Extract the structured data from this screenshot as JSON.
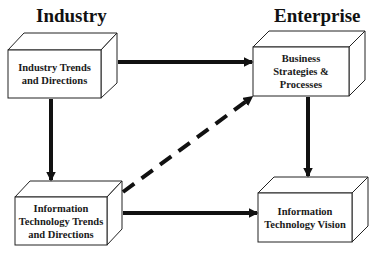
{
  "headings": {
    "left": "Industry",
    "right": "Enterprise"
  },
  "boxes": {
    "industry_trends": {
      "lines": [
        "Industry Trends",
        "and Directions"
      ]
    },
    "business_strategies": {
      "lines": [
        "Business",
        "Strategies &",
        "Processes"
      ]
    },
    "it_trends": {
      "lines": [
        "Information",
        "Technology Trends",
        "and Directions"
      ]
    },
    "it_vision": {
      "lines": [
        "Information",
        "Technology Vision"
      ]
    }
  },
  "connections": [
    {
      "from": "industry_trends",
      "to": "business_strategies",
      "style": "solid"
    },
    {
      "from": "industry_trends",
      "to": "it_trends",
      "style": "solid"
    },
    {
      "from": "it_trends",
      "to": "it_vision",
      "style": "solid"
    },
    {
      "from": "business_strategies",
      "to": "it_vision",
      "style": "solid"
    },
    {
      "from": "it_trends",
      "to": "business_strategies",
      "style": "dashed"
    }
  ],
  "colors": {
    "stroke": "#111111",
    "fill": "#ffffff"
  }
}
